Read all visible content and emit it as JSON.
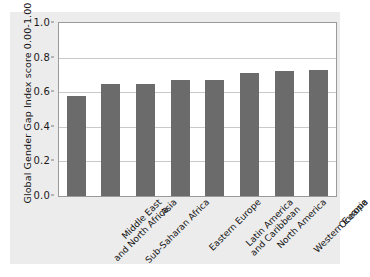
{
  "chart_data": {
    "type": "bar",
    "title": "",
    "xlabel": "",
    "ylabel": "Global Gender Gap Index score 0.00-1.00",
    "ylim": [
      0.0,
      1.0
    ],
    "yticks": [
      "0.0",
      "0.2",
      "0.4",
      "0.6",
      "0.8",
      "1.0"
    ],
    "ytick_values": [
      0.0,
      0.2,
      0.4,
      0.6,
      0.8,
      1.0
    ],
    "grid": true,
    "legend": "none",
    "bar_color": "#6b6b6b",
    "plot_background": "#ffffff",
    "figure_background": "#ececec",
    "categories": [
      "Middle East and North Africa",
      "Sub-Saharan Africa",
      "Asia",
      "Eastern Europe",
      "Latin America and Caribbean",
      "North America",
      "Western Europe",
      "Oceania"
    ],
    "category_lines": [
      [
        "Middle East",
        "and North Africa"
      ],
      [
        "Sub-Saharan Africa"
      ],
      [
        "Asia"
      ],
      [
        "Eastern Europe"
      ],
      [
        "Latin America",
        "and Caribbean"
      ],
      [
        "North America"
      ],
      [
        "Western Europe"
      ],
      [
        "Oceania"
      ]
    ],
    "values": [
      0.58,
      0.65,
      0.65,
      0.67,
      0.67,
      0.71,
      0.72,
      0.73
    ]
  }
}
